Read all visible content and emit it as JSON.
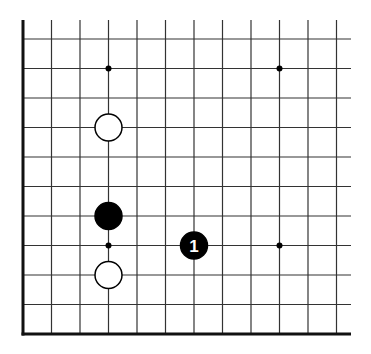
{
  "diagram": {
    "type": "go-board-fragment",
    "title": "",
    "board": {
      "columns": 12,
      "rows": 11,
      "edges": [
        "left",
        "bottom"
      ],
      "line_color": "#333333",
      "edge_color": "#111111",
      "background": "#ffffff"
    },
    "hoshi": [
      {
        "col": 3,
        "row": 1
      },
      {
        "col": 9,
        "row": 1
      },
      {
        "col": 3,
        "row": 7
      },
      {
        "col": 9,
        "row": 7
      }
    ],
    "stones": [
      {
        "color": "white",
        "col": 3,
        "row": 3,
        "label": ""
      },
      {
        "color": "black",
        "col": 3,
        "row": 6,
        "label": ""
      },
      {
        "color": "white",
        "col": 3,
        "row": 8,
        "label": ""
      },
      {
        "color": "black",
        "col": 6,
        "row": 7,
        "label": "1"
      }
    ]
  }
}
